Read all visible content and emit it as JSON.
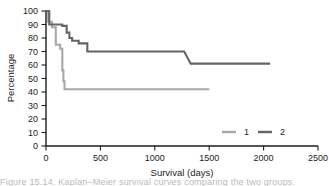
{
  "figure": {
    "background": "#ffffff",
    "caption_fragment": "Figure  15.14.  Kaplan–Meier  survival  curves  comparing  the  two  groups."
  },
  "chart_data": {
    "type": "line",
    "title": "",
    "subtitle": "",
    "xlabel": "Survival (days)",
    "ylabel": "Percentage",
    "xlim": [
      0,
      2500
    ],
    "ylim": [
      0,
      100
    ],
    "xticks": [
      0,
      500,
      1000,
      1500,
      2000,
      2500
    ],
    "yticks": [
      0,
      10,
      20,
      30,
      40,
      50,
      60,
      70,
      80,
      90,
      100
    ],
    "grid": false,
    "step_style": "post",
    "legend": {
      "position": "bottom-right",
      "entries": [
        {
          "name": "1",
          "color": "#a8a8a8"
        },
        {
          "name": "2",
          "color": "#646464"
        }
      ]
    },
    "series": [
      {
        "name": "1",
        "color": "#a8a8a8",
        "width": 2.1,
        "points": [
          [
            0,
            100
          ],
          [
            20,
            100
          ],
          [
            20,
            92
          ],
          [
            55,
            92
          ],
          [
            55,
            88
          ],
          [
            90,
            88
          ],
          [
            90,
            75
          ],
          [
            130,
            75
          ],
          [
            130,
            72
          ],
          [
            150,
            72
          ],
          [
            150,
            56
          ],
          [
            160,
            56
          ],
          [
            160,
            48
          ],
          [
            170,
            48
          ],
          [
            170,
            42
          ],
          [
            1500,
            42
          ]
        ]
      },
      {
        "name": "2",
        "color": "#646464",
        "width": 2.1,
        "points": [
          [
            0,
            100
          ],
          [
            30,
            100
          ],
          [
            30,
            90
          ],
          [
            150,
            90
          ],
          [
            150,
            89
          ],
          [
            190,
            89
          ],
          [
            190,
            84
          ],
          [
            215,
            84
          ],
          [
            215,
            80
          ],
          [
            240,
            80
          ],
          [
            240,
            78
          ],
          [
            300,
            78
          ],
          [
            300,
            76
          ],
          [
            380,
            76
          ],
          [
            380,
            70
          ],
          [
            1270,
            70
          ],
          [
            1330,
            61
          ],
          [
            2060,
            61
          ]
        ]
      }
    ],
    "annotations": []
  },
  "axes": {
    "x_title": "Survival (days)",
    "y_title": "Percentage",
    "x_tick_labels": [
      "0",
      "500",
      "1000",
      "1500",
      "2000",
      "2500"
    ],
    "y_tick_labels": [
      "0",
      "10",
      "20",
      "30",
      "40",
      "50",
      "60",
      "70",
      "80",
      "90",
      "100"
    ]
  }
}
